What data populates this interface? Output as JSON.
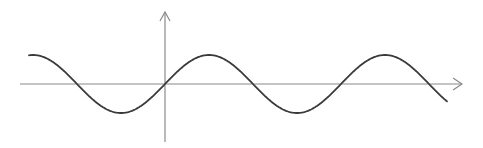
{
  "chart_data": {
    "type": "line",
    "title": "",
    "xlabel": "",
    "ylabel": "",
    "function": "y = sin(x)",
    "grid": false,
    "legend": null,
    "x_units_per_period": 6.283,
    "xlim": [
      -4.86,
      10.07
    ],
    "ylim": [
      -1.9,
      2.5
    ],
    "series": [
      {
        "name": "sin(x)",
        "key_points": [
          {
            "x": -4.86,
            "y": 0.99
          },
          {
            "x": -3.14,
            "y": 0
          },
          {
            "x": -1.57,
            "y": -1
          },
          {
            "x": 0,
            "y": 0
          },
          {
            "x": 1.57,
            "y": 1
          },
          {
            "x": 3.14,
            "y": 0
          },
          {
            "x": 4.71,
            "y": -1
          },
          {
            "x": 6.28,
            "y": 0
          },
          {
            "x": 7.85,
            "y": 1
          },
          {
            "x": 9.42,
            "y": 0
          },
          {
            "x": 10.07,
            "y": -0.6
          }
        ],
        "color": "#3a3a3a"
      }
    ],
    "axis_color": "#8a8a8a"
  },
  "render": {
    "origin_px": [
      165,
      84
    ],
    "period_px": 176,
    "amplitude_px": 29,
    "x_start_px": 29,
    "x_end_px": 447,
    "x_axis": {
      "x1": 20,
      "x2": 462,
      "y": 84
    },
    "y_axis": {
      "x": 165,
      "y1": 12,
      "y2": 142
    }
  }
}
